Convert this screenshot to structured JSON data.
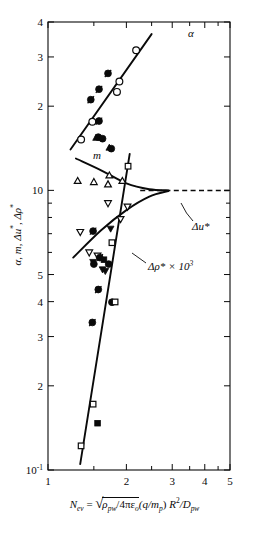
{
  "chart_data": {
    "type": "scatter",
    "title": "",
    "xlabel_text": "N_ev = sqrt( rho_pw / 4*pi*epsilon_o ) (q/m_p) R^2 / D_pw",
    "ylabel_text": "alpha, m, delta-u*, delta-rho*",
    "xscale": "log",
    "yscale": "log",
    "xlim": [
      1,
      5
    ],
    "ylim": [
      0.1,
      4
    ],
    "grid": false,
    "legend_position": "inline-annotations",
    "xticks_major": [
      1,
      2,
      3,
      4,
      5
    ],
    "xtick_labels": [
      "1",
      "2",
      "3",
      "4",
      "5"
    ],
    "yticks_major": [
      4,
      3,
      2,
      1.0,
      0.5,
      0.4,
      0.3,
      0.2,
      0.1
    ],
    "ytick_labels": [
      "4",
      "3",
      "2",
      "10",
      "5",
      "4",
      "3",
      "2",
      "10⁻¹"
    ],
    "annotations": [
      {
        "id": "alpha",
        "label": "α",
        "x": 2.42,
        "y": 3.62
      },
      {
        "id": "m",
        "label": "m",
        "x": 1.45,
        "y": 1.36
      },
      {
        "id": "delta-u-star",
        "label": "Δu*",
        "x": 2.62,
        "y": 0.7
      },
      {
        "id": "delta-rho-star",
        "label": "Δρ* × 10³",
        "x": 2.3,
        "y": 0.5
      }
    ],
    "series": [
      {
        "name": "alpha-fit-line",
        "type": "line",
        "points": [
          [
            1.22,
            1.4
          ],
          [
            2.5,
            3.62
          ]
        ]
      },
      {
        "name": "m-fit-curve",
        "type": "curve",
        "points": [
          [
            1.28,
            1.3
          ],
          [
            1.6,
            1.18
          ],
          [
            2.0,
            1.06
          ],
          [
            2.45,
            1.01
          ],
          [
            2.9,
            1.0
          ]
        ]
      },
      {
        "name": "delta-u-star-fit-curve",
        "type": "curve",
        "points": [
          [
            1.25,
            0.575
          ],
          [
            1.6,
            0.72
          ],
          [
            2.0,
            0.85
          ],
          [
            2.45,
            0.95
          ],
          [
            2.9,
            0.995
          ]
        ]
      },
      {
        "name": "delta-u-star-dashed-extension",
        "type": "dashed",
        "points": [
          [
            2.26,
            1.0
          ],
          [
            5.0,
            1.0
          ]
        ]
      },
      {
        "name": "delta-rho-star-fit-line",
        "type": "line",
        "points": [
          [
            1.33,
            0.105
          ],
          [
            2.06,
            1.35
          ]
        ]
      },
      {
        "name": "alpha-open-circle",
        "type": "scatter",
        "marker": "open-circle",
        "points": [
          [
            1.34,
            1.52
          ],
          [
            1.48,
            1.76
          ],
          [
            1.84,
            2.25
          ],
          [
            1.88,
            2.45
          ],
          [
            2.18,
            3.17
          ]
        ]
      },
      {
        "name": "alpha-filled-circle",
        "type": "scatter",
        "marker": "filled-circle",
        "points": [
          [
            1.46,
            2.11
          ],
          [
            1.57,
            2.3
          ],
          [
            1.7,
            2.62
          ],
          [
            1.57,
            1.77
          ],
          [
            1.56,
            1.55
          ],
          [
            1.62,
            1.53
          ],
          [
            1.75,
            1.41
          ]
        ]
      },
      {
        "name": "alpha-filled-triangle-up",
        "type": "scatter",
        "marker": "filled-triangle-up",
        "points": [
          [
            1.53,
            1.54
          ],
          [
            1.72,
            1.42
          ]
        ]
      },
      {
        "name": "m-open-triangle-up",
        "type": "scatter",
        "marker": "open-triangle-up",
        "points": [
          [
            1.3,
            1.08
          ],
          [
            1.5,
            1.07
          ],
          [
            1.7,
            1.05
          ],
          [
            1.72,
            1.13
          ],
          [
            1.93,
            1.08
          ]
        ]
      },
      {
        "name": "delta-u-open-triangle-down",
        "type": "scatter",
        "marker": "open-triangle-down",
        "points": [
          [
            1.33,
            0.71
          ],
          [
            1.44,
            0.6
          ],
          [
            1.55,
            0.585
          ],
          [
            1.7,
            0.9
          ],
          [
            1.9,
            0.79
          ],
          [
            2.02,
            0.875
          ]
        ]
      },
      {
        "name": "delta-u-filled-triangle-down",
        "type": "scatter",
        "marker": "filled-triangle-down",
        "points": [
          [
            1.49,
            0.555
          ],
          [
            1.74,
            0.73
          ],
          [
            1.66,
            0.515
          ]
        ]
      },
      {
        "name": "mid-filled-circle",
        "type": "scatter",
        "marker": "filled-circle",
        "points": [
          [
            1.49,
            0.715
          ],
          [
            1.58,
            0.575
          ],
          [
            1.5,
            0.545
          ],
          [
            1.71,
            0.545
          ]
        ]
      },
      {
        "name": "mid-filled-square",
        "type": "scatter",
        "marker": "filled-square",
        "points": [
          [
            1.64,
            0.565
          ]
        ]
      },
      {
        "name": "mid-open-square",
        "type": "scatter",
        "marker": "open-square",
        "points": [
          [
            1.76,
            0.65
          ],
          [
            2.03,
            1.22
          ]
        ]
      },
      {
        "name": "rho-filled-circle",
        "type": "scatter",
        "marker": "filled-circle",
        "points": [
          [
            1.56,
            0.442
          ],
          [
            1.48,
            0.337
          ],
          [
            1.76,
            0.398
          ]
        ]
      },
      {
        "name": "rho-filled-triangle-down",
        "type": "scatter",
        "marker": "filled-triangle-down",
        "points": [
          [
            1.62,
            0.522
          ]
        ]
      },
      {
        "name": "rho-open-square",
        "type": "scatter",
        "marker": "open-square",
        "points": [
          [
            1.81,
            0.399
          ],
          [
            1.49,
            0.172
          ],
          [
            1.34,
            0.122
          ]
        ]
      },
      {
        "name": "rho-filled-square",
        "type": "scatter",
        "marker": "filled-square",
        "points": [
          [
            1.55,
            0.147
          ]
        ]
      }
    ]
  },
  "axis": {
    "ylabel": {
      "alpha": "α",
      "comma1": ", ",
      "m": "m",
      "comma2": ", ",
      "du": "Δu",
      "star1": "*",
      "comma3": ", ",
      "drho": "Δρ",
      "star2": "*"
    },
    "xlabel": {
      "n": "N",
      "n_sub": "ev",
      "eq": " = ",
      "rho_pw": "ρ",
      "rho_sub": "pw",
      "slash1": "/4πε",
      "eps_sub": "o",
      "q": "(q/m",
      "mp_sub": "p",
      "close": ")",
      "r": "R",
      "r_sup": "2",
      "slash2": "/D",
      "d_sub": "pw"
    }
  },
  "labels": {
    "alpha": "α",
    "m": "m",
    "delta_u_star": "Δu*",
    "delta_rho_star": "Δρ*",
    "times_10_3": "× 10",
    "exp_3": "3"
  },
  "colors": {
    "ink": "#0a0a0a",
    "background": "#ffffff",
    "marker_fill": "#0a0a0a",
    "marker_open": "#ffffff"
  }
}
